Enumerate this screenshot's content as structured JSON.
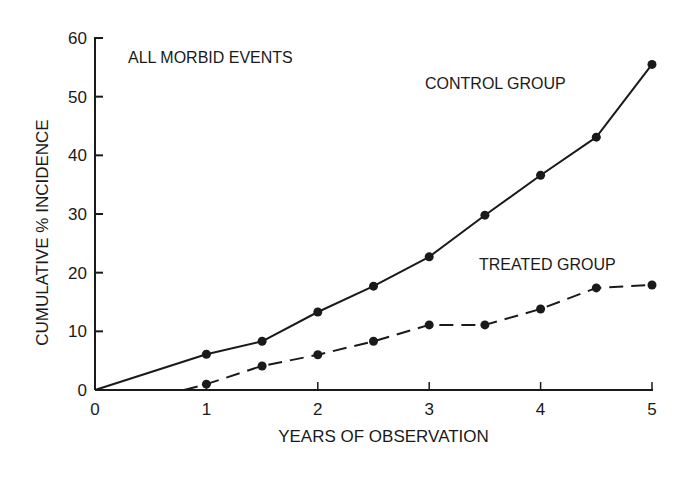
{
  "chart_data": {
    "type": "line",
    "title": "ALL MORBID EVENTS",
    "xlabel": "YEARS OF OBSERVATION",
    "ylabel": "CUMULATIVE % INCIDENCE",
    "xlim": [
      0,
      5
    ],
    "ylim": [
      0,
      60
    ],
    "x_ticks": [
      0,
      1,
      2,
      3,
      4,
      5
    ],
    "y_ticks": [
      0,
      10,
      20,
      30,
      40,
      50,
      60
    ],
    "grid": false,
    "legend": "inline labels",
    "series": [
      {
        "name": "CONTROL GROUP",
        "style": "solid",
        "x": [
          0,
          1,
          1.5,
          2,
          2.5,
          3,
          3.5,
          4,
          4.5,
          5
        ],
        "values": [
          0,
          6.1,
          8.3,
          13.3,
          17.7,
          22.7,
          29.8,
          36.6,
          43.1,
          55.5
        ],
        "markers": [
          false,
          true,
          true,
          true,
          true,
          true,
          true,
          true,
          true,
          true
        ]
      },
      {
        "name": "TREATED GROUP",
        "style": "dashed",
        "x": [
          0.8,
          1,
          1.5,
          2,
          2.5,
          3,
          3.5,
          4,
          4.5,
          5
        ],
        "values": [
          0,
          1.0,
          4.1,
          6.0,
          8.3,
          11.1,
          11.1,
          13.8,
          17.4,
          17.9
        ],
        "markers": [
          false,
          true,
          true,
          true,
          true,
          true,
          true,
          true,
          true,
          true
        ]
      }
    ],
    "annotations": [
      {
        "text": "ALL MORBID EVENTS",
        "x": 0.2,
        "y": 56
      },
      {
        "text": "CONTROL GROUP",
        "x": 3.0,
        "y": 50
      },
      {
        "text": "TREATED GROUP",
        "x": 3.4,
        "y": 20.3
      }
    ]
  },
  "colors": {
    "ink": "#1a1a1a",
    "background": "#ffffff"
  }
}
